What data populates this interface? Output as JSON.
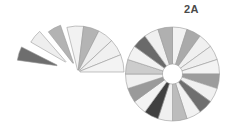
{
  "figure": {
    "label": "2A",
    "stroke_color": "#9a9a9a",
    "background": "#ffffff"
  },
  "partial_wheel": {
    "center": [
      78,
      72
    ],
    "outer_radius": 46,
    "inner_radius": 2,
    "fan_segments": [
      {
        "start_deg": -14,
        "end_deg": 7,
        "fill": "#f2f2f2"
      },
      {
        "start_deg": 7,
        "end_deg": 27,
        "fill": "#b4b4b4"
      },
      {
        "start_deg": 27,
        "end_deg": 47,
        "fill": "#eeeeee"
      },
      {
        "start_deg": 47,
        "end_deg": 68,
        "fill": "#f0f0f0"
      },
      {
        "start_deg": 68,
        "end_deg": 90,
        "fill": "#f3f3f3"
      }
    ],
    "exploded_segments": [
      {
        "start_deg": -38,
        "end_deg": -19,
        "fill": "#b3b3b3",
        "offset": 8
      },
      {
        "start_deg": -60,
        "end_deg": -41,
        "fill": "#eeeeee",
        "offset": 14
      },
      {
        "start_deg": -82,
        "end_deg": -63,
        "fill": "#6e6e6e",
        "offset": 20
      }
    ]
  },
  "full_wheel": {
    "center": [
      172.5,
      74
    ],
    "outer_radius": 47,
    "inner_radius": 10,
    "segments": [
      {
        "fill": "#f2f2f2"
      },
      {
        "fill": "#aaaaaa"
      },
      {
        "fill": "#f0f0f0"
      },
      {
        "fill": "#eeeeee"
      },
      {
        "fill": "#f3f3f3"
      },
      {
        "fill": "#9c9c9c"
      },
      {
        "fill": "#f0f0f0"
      },
      {
        "fill": "#6f6f6f"
      },
      {
        "fill": "#f2f2f2"
      },
      {
        "fill": "#bcbcbc"
      },
      {
        "fill": "#f0f0f0"
      },
      {
        "fill": "#404040"
      },
      {
        "fill": "#f3f3f3"
      },
      {
        "fill": "#9a9a9a"
      },
      {
        "fill": "#f0f0f0"
      },
      {
        "fill": "#cccccc"
      },
      {
        "fill": "#f2f2f2"
      },
      {
        "fill": "#6a6a6a"
      },
      {
        "fill": "#f0f0f0"
      },
      {
        "fill": "#b0b0b0"
      }
    ]
  }
}
